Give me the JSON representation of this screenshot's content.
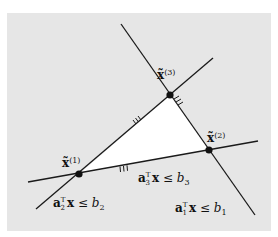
{
  "figure": {
    "panel": {
      "x": 7,
      "y": 13,
      "width": 264,
      "height": 218,
      "fill": "#e6e6e6"
    },
    "feasible_region_fill": "#ffffff",
    "line_color": "#1a1a1a",
    "vertex_color": "#111111"
  },
  "lines": [
    {
      "id": "line-1",
      "x1": 121,
      "y1": 24,
      "x2": 255,
      "y2": 215
    },
    {
      "id": "line-2",
      "x1": 36,
      "y1": 209,
      "x2": 213,
      "y2": 58
    },
    {
      "id": "line-3",
      "x1": 28,
      "y1": 182,
      "x2": 258,
      "y2": 141
    }
  ],
  "vertices": [
    {
      "id": "vertex-1",
      "x": 79,
      "y": 174,
      "label_base": "x̃",
      "label_sup": "(1)",
      "lx": 62,
      "ly": 167
    },
    {
      "id": "vertex-2",
      "x": 209,
      "y": 150,
      "label_base": "x̃",
      "label_sup": "(2)",
      "lx": 207,
      "ly": 142
    },
    {
      "id": "vertex-3",
      "x": 170,
      "y": 95,
      "label_base": "x̃",
      "label_sup": "(3)",
      "lx": 157,
      "ly": 79
    }
  ],
  "constraints": [
    {
      "id": "constraint-1",
      "a": "a",
      "sub": "1",
      "sup": "T",
      "rest": "x ≤ b",
      "b_sub": "1",
      "x": 175,
      "y": 212
    },
    {
      "id": "constraint-2",
      "a": "a",
      "sub": "2",
      "sup": "T",
      "rest": "x ≤ b",
      "b_sub": "2",
      "x": 53,
      "y": 207
    },
    {
      "id": "constraint-3",
      "a": "a",
      "sub": "3",
      "sup": "T",
      "rest": "x ≤ b",
      "b_sub": "3",
      "x": 138,
      "y": 182
    }
  ],
  "hatches": [
    {
      "id": "hatch-line-2",
      "marks": "III"
    },
    {
      "id": "hatch-line-1",
      "marks": "III"
    },
    {
      "id": "hatch-line-3",
      "marks": "III"
    }
  ]
}
